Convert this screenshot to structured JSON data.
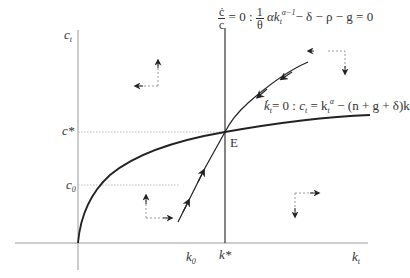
{
  "diagram": {
    "type": "phase-diagram",
    "axes": {
      "y_label": "c",
      "y_label_sub": "t",
      "x_label": "k",
      "x_label_sub": "t"
    },
    "ticks": {
      "c_star": "c*",
      "c_zero": "c",
      "c_zero_sub": "0",
      "k_zero": "k",
      "k_zero_sub": "0",
      "k_star": "k*"
    },
    "equilibrium_label": "E",
    "c_dot_locus": {
      "lhs_num": "ċ",
      "lhs_den": "c",
      "eq_zero": "= 0 :",
      "frac_num": "1",
      "frac_den": "θ",
      "term": "αk",
      "term_sub": "t",
      "term_sup": "α−1",
      "rest": "− δ − ρ − g = 0"
    },
    "k_dot_locus": {
      "lhs": "k̇",
      "lhs_sub": "t",
      "eq_zero": "= 0 : ",
      "c": "c",
      "c_sub": "t",
      "eq": " = k",
      "k_sub": "t",
      "k_sup": "α",
      "rest": " − (n + g + δ)k"
    },
    "colors": {
      "axis": "#9a9a9a",
      "curve": "#222222",
      "dashed": "#aaaaaa",
      "text": "#333333"
    }
  }
}
